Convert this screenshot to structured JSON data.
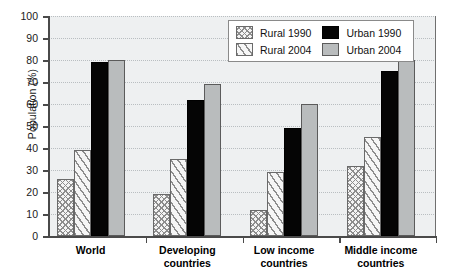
{
  "chart_data": {
    "type": "bar",
    "title": "",
    "xlabel": "",
    "ylabel": "Population (%)",
    "ylim": [
      0,
      100
    ],
    "ytick_step": 10,
    "yticks": [
      0,
      10,
      20,
      30,
      40,
      50,
      60,
      70,
      80,
      90,
      100
    ],
    "grid": true,
    "legend_position": "top-right",
    "categories": [
      "World",
      "Developing countries",
      "Low income countries",
      "Middle income countries"
    ],
    "category_lines": [
      [
        "World"
      ],
      [
        "Developing",
        "countries"
      ],
      [
        "Low income",
        "countries"
      ],
      [
        "Middle income",
        "countries"
      ]
    ],
    "series": [
      {
        "name": "Rural 1990",
        "key": "rural1990",
        "pattern": "crosshatch",
        "values": [
          26,
          19,
          12,
          32
        ]
      },
      {
        "name": "Rural 2004",
        "key": "rural2004",
        "pattern": "diagonal-stripes",
        "values": [
          39,
          35,
          29,
          45
        ]
      },
      {
        "name": "Urban 1990",
        "key": "urban1990",
        "pattern": "solid-black",
        "color": "#050505",
        "values": [
          79,
          62,
          49,
          75
        ]
      },
      {
        "name": "Urban 2004",
        "key": "urban2004",
        "pattern": "solid-gray",
        "color": "#b9bcbd",
        "values": [
          80,
          69,
          60,
          80
        ]
      }
    ]
  },
  "legend": {
    "entries": [
      {
        "label": "Rural 1990",
        "key": "rural1990"
      },
      {
        "label": "Urban 1990",
        "key": "urban1990"
      },
      {
        "label": "Rural 2004",
        "key": "rural2004"
      },
      {
        "label": "Urban 2004",
        "key": "urban2004"
      }
    ]
  },
  "colors": {
    "plot_background": "#eef0f1",
    "axis": "#4a4a4a",
    "gridline": "#b9bec1",
    "urban_1990": "#050505",
    "urban_2004": "#b9bcbd",
    "rural_outline": "#6a6a6a"
  }
}
